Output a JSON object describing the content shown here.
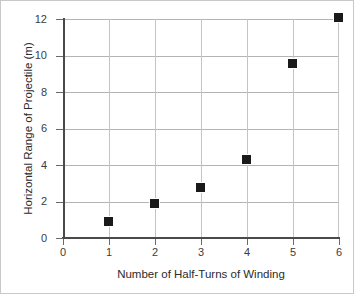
{
  "chart_data": {
    "type": "scatter",
    "title": "",
    "xlabel": "Number of Half-Turns of Winding",
    "ylabel": "Horizontal Range of Projectile (m)",
    "xlim": [
      0,
      6
    ],
    "ylim": [
      0,
      12
    ],
    "xticks": [
      "0",
      "1",
      "2",
      "3",
      "4",
      "5",
      "6"
    ],
    "yticks": [
      "0",
      "2",
      "4",
      "6",
      "8",
      "10",
      "12"
    ],
    "xtick_values": [
      0,
      1,
      2,
      3,
      4,
      5,
      6
    ],
    "ytick_values": [
      0,
      2,
      4,
      6,
      8,
      10,
      12
    ],
    "grid": "horizontal-and-vertical",
    "legend": "none",
    "marker": {
      "shape": "filled-square",
      "color": "#1a1a1a",
      "edge_color": "#ffffff"
    },
    "x": [
      1,
      2,
      3,
      4,
      5,
      6
    ],
    "values": [
      0.9,
      1.85,
      2.75,
      4.25,
      9.55,
      12.05
    ],
    "points": [
      {
        "x": 1,
        "y": 0.9
      },
      {
        "x": 2,
        "y": 1.85
      },
      {
        "x": 3,
        "y": 2.75
      },
      {
        "x": 4,
        "y": 4.25
      },
      {
        "x": 5,
        "y": 9.55
      },
      {
        "x": 6,
        "y": 12.05
      }
    ]
  },
  "colors": {
    "background": "#ffffff",
    "grid": "#b4b4b4",
    "axis": "#4a4a4a",
    "text": "#2b2b2b",
    "marker": "#1a1a1a"
  }
}
